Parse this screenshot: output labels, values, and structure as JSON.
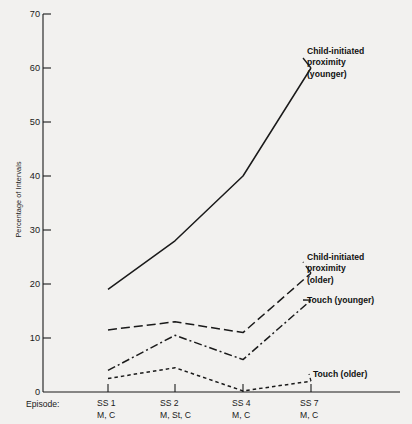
{
  "chart_data": {
    "type": "line",
    "title": "",
    "xlabel": "Episode:",
    "ylabel": "Percentage of Intervals",
    "ylim": [
      0,
      70
    ],
    "yticks": [
      0,
      10,
      20,
      30,
      40,
      50,
      60,
      70
    ],
    "ytick_labels": [
      "0",
      "10",
      "20",
      "30",
      "40",
      "50",
      "60",
      "70"
    ],
    "grid": false,
    "legend_position": "inline-right",
    "categories": [
      "SS 1",
      "SS 2",
      "SS 4",
      "SS 7"
    ],
    "category_sublabels": [
      "M, C",
      "M, St, C",
      "M, C",
      "M, C"
    ],
    "series": [
      {
        "name": "Child-initiated proximity (younger)",
        "label_lines": [
          "Child-initiated",
          "proximity",
          "(younger)"
        ],
        "style": "solid",
        "values": [
          19,
          28,
          40,
          60
        ]
      },
      {
        "name": "Child-initiated proximity (older)",
        "label_lines": [
          "Child-initiated",
          "proximity",
          "(older)"
        ],
        "style": "long-dash",
        "values": [
          11.5,
          13,
          11,
          22
        ]
      },
      {
        "name": "Touch (younger)",
        "label_lines": [
          "Touch (younger)"
        ],
        "style": "dash-dot",
        "values": [
          4,
          10.5,
          6,
          17
        ]
      },
      {
        "name": "Touch (older)",
        "label_lines": [
          "Touch (older)"
        ],
        "style": "short-dash",
        "values": [
          2.5,
          4.5,
          0.2,
          2
        ]
      }
    ],
    "colors": {
      "line": "#1a1a1a",
      "axis": "#1a1a1a",
      "background": "#f2f1ef"
    }
  },
  "axis": {
    "y_label": "Percentage of Intervals",
    "y_ticks": [
      "70",
      "60",
      "50",
      "40",
      "30",
      "20",
      "10",
      "0"
    ],
    "x_prefix": "Episode:",
    "x_ticks": [
      {
        "top": "SS 1",
        "bottom": "M, C"
      },
      {
        "top": "SS 2",
        "bottom": "M, St, C"
      },
      {
        "top": "SS 4",
        "bottom": "M, C"
      },
      {
        "top": "SS 7",
        "bottom": "M, C"
      }
    ]
  },
  "annotations": {
    "child_younger_l1": "Child-initiated",
    "child_younger_l2": "proximity",
    "child_younger_l3": "(younger)",
    "child_older_l1": "Child-initiated",
    "child_older_l2": "proximity",
    "child_older_l3": "(older)",
    "touch_younger": "Touch (younger)",
    "touch_older": "Touch (older)"
  }
}
